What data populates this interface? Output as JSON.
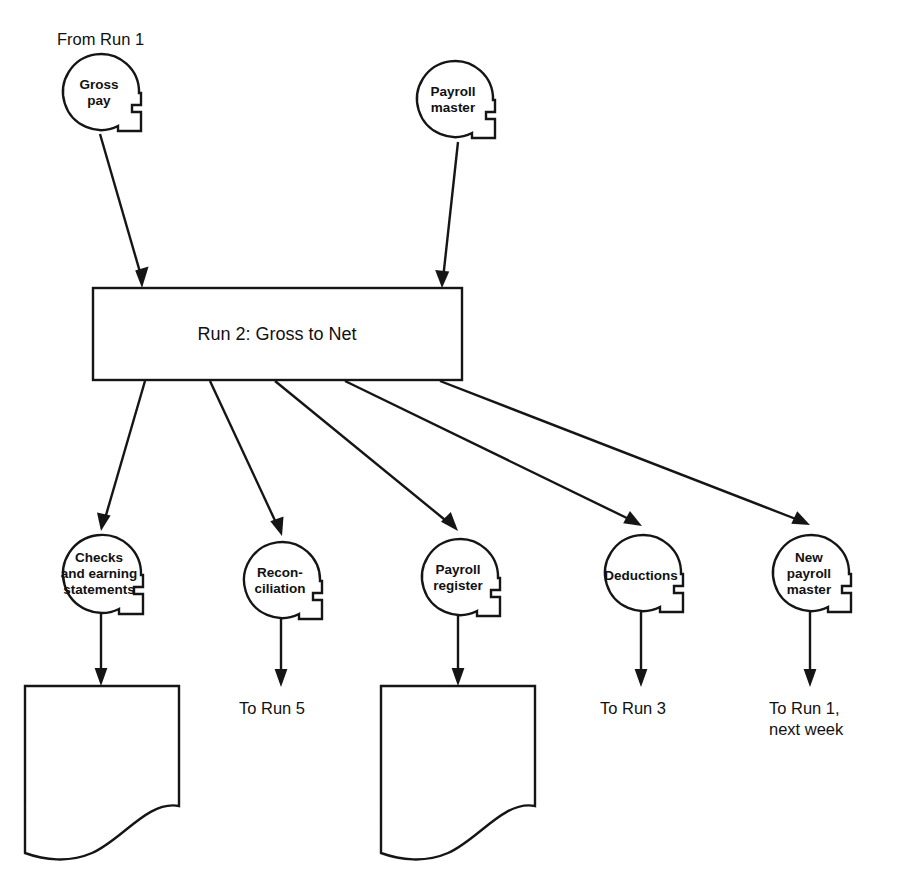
{
  "diagram": {
    "title_note": "Payroll processing system flowchart — Run 2",
    "background_color": "#ffffff",
    "line_color": "#151515"
  },
  "labels": {
    "from_run_1": "From Run 1",
    "to_run_5": "To Run 5",
    "to_run_3": "To Run 3",
    "to_run_1_line1": "To Run 1,",
    "to_run_1_line2": "next week"
  },
  "process": {
    "label": "Run 2: Gross to Net"
  },
  "inputs": [
    {
      "id": "gross-pay",
      "lines": [
        "Gross",
        "pay"
      ],
      "symbol": "magnetic-tape"
    },
    {
      "id": "payroll-master",
      "lines": [
        "Payroll",
        "master"
      ],
      "symbol": "magnetic-tape"
    }
  ],
  "outputs": [
    {
      "id": "checks-and-earning-statements",
      "lines": [
        "Checks",
        "and earning",
        "statements"
      ],
      "symbol": "magnetic-tape"
    },
    {
      "id": "reconciliation",
      "lines": [
        "Recon-",
        "ciliation"
      ],
      "symbol": "magnetic-tape"
    },
    {
      "id": "payroll-register",
      "lines": [
        "Payroll",
        "register"
      ],
      "symbol": "magnetic-tape"
    },
    {
      "id": "deductions",
      "lines": [
        "Deductions"
      ],
      "symbol": "magnetic-tape"
    },
    {
      "id": "new-payroll-master",
      "lines": [
        "New",
        "payroll",
        "master"
      ],
      "symbol": "magnetic-tape"
    }
  ],
  "documents": [
    {
      "id": "document-checks",
      "symbol": "document"
    },
    {
      "id": "document-payroll-register",
      "symbol": "document"
    }
  ]
}
